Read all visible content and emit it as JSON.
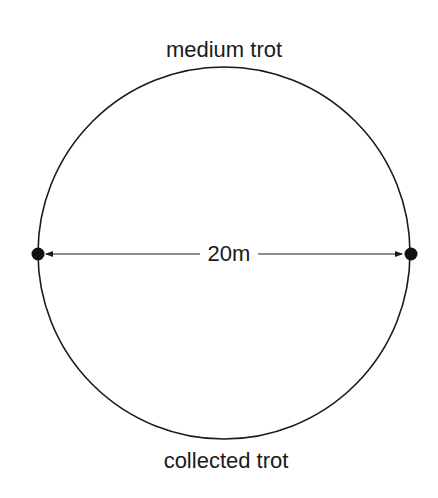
{
  "diagram": {
    "top_label": "medium trot",
    "bottom_label": "collected trot",
    "diameter_label": "20m",
    "circle": {
      "cx": 224,
      "cy": 253,
      "r": 186
    },
    "colors": {
      "stroke": "#1a1a1a",
      "background": "#ffffff"
    }
  }
}
